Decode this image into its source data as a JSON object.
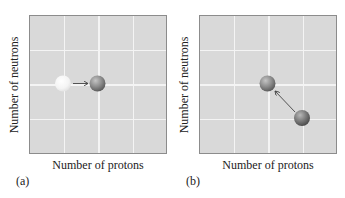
{
  "figure": {
    "panels": [
      {
        "id": "a",
        "label": "(a)",
        "xlabel": "Number of protons",
        "ylabel": "Number of neutrons",
        "nucleus_from": {
          "col": 1,
          "row": 2,
          "style": "white"
        },
        "nucleus_to": {
          "col": 2,
          "row": 2,
          "style": "gray"
        },
        "transition": "proton number increases by one; neutron number unchanged"
      },
      {
        "id": "b",
        "label": "(b)",
        "xlabel": "Number of protons",
        "ylabel": "Number of neutrons",
        "nucleus_from": {
          "col": 3,
          "row": 3,
          "style": "gray"
        },
        "nucleus_to": {
          "col": 2,
          "row": 2,
          "style": "gray"
        },
        "transition": "proton number decreases by one; neutron number increases by one"
      }
    ],
    "grid": {
      "columns": 4,
      "rows": 4
    },
    "colors": {
      "plot_background": "#d9d9d9",
      "gridline": "#f4f4f4",
      "frame": "#8c8c8c",
      "nucleus_gray": "#8a8a8a",
      "nucleus_white": "#f7f7f7",
      "arrow": "#444444"
    }
  }
}
